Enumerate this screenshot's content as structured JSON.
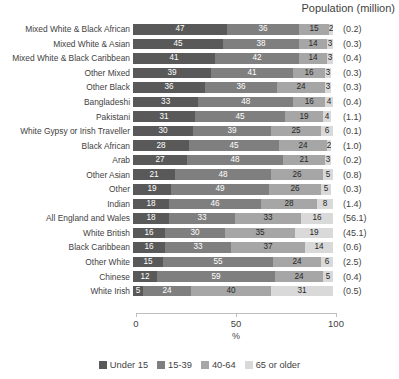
{
  "header": {
    "population_header": "Population (million)"
  },
  "axis": {
    "xlabel": "%",
    "ticks": [
      "0",
      "50",
      "100"
    ]
  },
  "legend": {
    "items": [
      {
        "label": "Under 15",
        "color": "#595959"
      },
      {
        "label": "15-39",
        "color": "#7f7f7f"
      },
      {
        "label": "40-64",
        "color": "#a6a6a6"
      },
      {
        "label": "65 or older",
        "color": "#d9d9d9"
      }
    ]
  },
  "chart_data": {
    "type": "bar",
    "orientation": "horizontal",
    "stacked": true,
    "title": "",
    "xlabel": "%",
    "ylabel": "",
    "xlim": [
      0,
      100
    ],
    "grid": false,
    "legend_position": "bottom",
    "categories": [
      "Mixed White & Black African",
      "Mixed White & Asian",
      "Mixed White & Black Caribbean",
      "Other Mixed",
      "Other Black",
      "Bangladeshi",
      "Pakistani",
      "White Gypsy or Irish Traveller",
      "Black African",
      "Arab",
      "Other Asian",
      "Other",
      "Indian",
      "All England and Wales",
      "White British",
      "Black Caribbean",
      "Other White",
      "Chinese",
      "White Irish"
    ],
    "series": [
      {
        "name": "Under 15",
        "values": [
          47,
          45,
          41,
          39,
          36,
          33,
          31,
          30,
          28,
          27,
          21,
          19,
          18,
          18,
          16,
          16,
          15,
          12,
          5
        ]
      },
      {
        "name": "15-39",
        "values": [
          36,
          38,
          42,
          41,
          36,
          48,
          45,
          39,
          45,
          48,
          48,
          49,
          46,
          33,
          30,
          33,
          55,
          59,
          24
        ]
      },
      {
        "name": "40-64",
        "values": [
          15,
          14,
          14,
          16,
          24,
          16,
          19,
          25,
          24,
          21,
          26,
          26,
          28,
          33,
          35,
          37,
          24,
          24,
          40
        ]
      },
      {
        "name": "65 or older",
        "values": [
          2,
          3,
          3,
          3,
          3,
          4,
          4,
          6,
          2,
          3,
          5,
          5,
          8,
          16,
          19,
          14,
          6,
          5,
          31
        ]
      }
    ],
    "population_millions": [
      "(0.2)",
      "(0.3)",
      "(0.4)",
      "(0.3)",
      "(0.3)",
      "(0.4)",
      "(1.1)",
      "(0.1)",
      "(1.0)",
      "(0.2)",
      "(0.8)",
      "(0.3)",
      "(1.4)",
      "(56.1)",
      "(45.1)",
      "(0.6)",
      "(2.5)",
      "(0.4)",
      "(0.5)"
    ]
  }
}
